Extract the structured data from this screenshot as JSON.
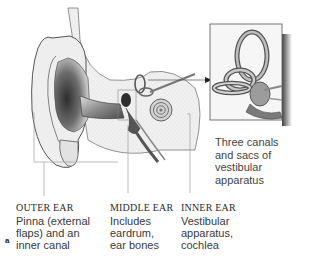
{
  "figure": {
    "panel_letter": "a",
    "inset_caption": [
      "Three canals",
      "and sacs of",
      "vestibular",
      "apparatus"
    ],
    "labels": [
      {
        "heading": "OUTER EAR",
        "lines": [
          "Pinna (external",
          "flaps) and an",
          "inner canal"
        ]
      },
      {
        "heading": "MIDDLE EAR",
        "lines": [
          "Includes",
          "eardrum,",
          "ear bones"
        ]
      },
      {
        "heading": "INNER EAR",
        "lines": [
          "Vestibular",
          "apparatus,",
          "cochlea"
        ]
      }
    ],
    "colors": {
      "outline": "#555555",
      "shade_dark": "#3a3a3a",
      "shade_mid": "#9a9a9a",
      "shade_light": "#e4e4e4",
      "leader_line": "#9e9e9e",
      "inset_shadow": "#2a2a2a"
    }
  }
}
